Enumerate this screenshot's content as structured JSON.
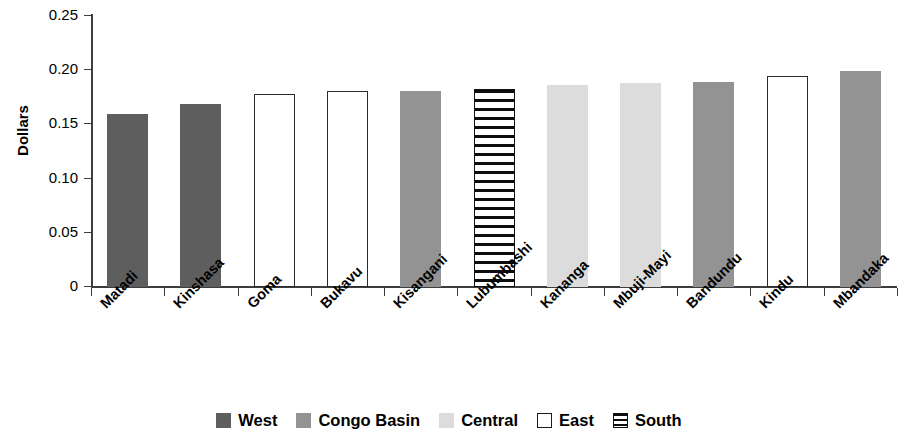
{
  "chart_data": {
    "type": "bar",
    "title": "",
    "xlabel": "",
    "ylabel": "Dollars",
    "ylim": [
      0,
      0.25
    ],
    "ytick_labels": [
      "0.25",
      "0.20",
      "0.15",
      "0.10",
      "0.05",
      "0"
    ],
    "ytick_values": [
      0.25,
      0.2,
      0.15,
      0.1,
      0.05,
      0
    ],
    "grid": false,
    "legend_position": "bottom-center",
    "categories": [
      "Matadi",
      "Kinshasa",
      "Goma",
      "Bukavu",
      "Kisangani",
      "Lubumbashi",
      "Kananga",
      "Mbuji-Mayi",
      "Bandundu",
      "Kindu",
      "Mbandaka"
    ],
    "values": [
      0.16,
      0.169,
      0.178,
      0.181,
      0.181,
      0.183,
      0.186,
      0.188,
      0.189,
      0.195,
      0.199
    ],
    "bar_groups": [
      "West",
      "West",
      "East",
      "East",
      "Congo Basin",
      "South",
      "Central",
      "Central",
      "Congo Basin",
      "East",
      "Congo Basin"
    ],
    "legend": [
      {
        "label": "West",
        "style": "solid",
        "color": "#5e5e5e"
      },
      {
        "label": "Congo Basin",
        "style": "solid",
        "color": "#939393"
      },
      {
        "label": "Central",
        "style": "solid",
        "color": "#dcdcdc"
      },
      {
        "label": "East",
        "style": "hollow",
        "color": "#ffffff"
      },
      {
        "label": "South",
        "style": "hatch",
        "color": "#0d0d0d"
      }
    ]
  }
}
